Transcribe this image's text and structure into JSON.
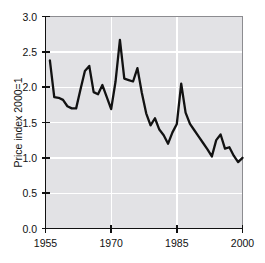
{
  "chart_data": {
    "type": "line",
    "title": "",
    "subtitle": "",
    "xlabel": "",
    "ylabel": "Price index 2000=1",
    "xlim": [
      1955,
      2000
    ],
    "ylim": [
      0.0,
      3.0
    ],
    "grid": true,
    "legend": "none",
    "x_ticks": [
      "1955",
      "1970",
      "1985",
      "2000"
    ],
    "x_tick_values": [
      1955,
      1970,
      1985,
      2000
    ],
    "y_ticks": [
      "0.0",
      "0.5",
      "1.0",
      "1.5",
      "2.0",
      "2.5",
      "3.0"
    ],
    "y_tick_values": [
      0.0,
      0.5,
      1.0,
      1.5,
      2.0,
      2.5,
      3.0
    ],
    "series": [
      {
        "name": "Price index 2000=1",
        "color": "#121212",
        "x": [
          1956,
          1957,
          1958,
          1959,
          1960,
          1961,
          1962,
          1963,
          1964,
          1965,
          1966,
          1967,
          1968,
          1969,
          1970,
          1971,
          1972,
          1973,
          1974,
          1975,
          1976,
          1977,
          1978,
          1979,
          1980,
          1981,
          1982,
          1983,
          1984,
          1985,
          1986,
          1987,
          1988,
          1989,
          1990,
          1991,
          1992,
          1993,
          1994,
          1995,
          1996,
          1997,
          1998,
          1999,
          2000
        ],
        "values": [
          2.38,
          1.86,
          1.85,
          1.82,
          1.73,
          1.7,
          1.7,
          1.97,
          2.23,
          2.3,
          1.93,
          1.9,
          2.03,
          1.86,
          1.69,
          2.08,
          2.67,
          2.12,
          2.1,
          2.08,
          2.27,
          1.92,
          1.63,
          1.46,
          1.56,
          1.4,
          1.32,
          1.2,
          1.36,
          1.48,
          2.05,
          1.64,
          1.48,
          1.39,
          1.3,
          1.21,
          1.12,
          1.02,
          1.25,
          1.33,
          1.13,
          1.15,
          1.03,
          0.94,
          1.0
        ]
      }
    ]
  },
  "axes": {
    "ylabel": "Price index 2000=1",
    "y_tick_labels": [
      "3.0",
      "2.5",
      "2.0",
      "1.5",
      "1.0",
      "0.5",
      "0.0"
    ],
    "x_tick_labels": [
      "1955",
      "1970",
      "1985",
      "2000"
    ]
  },
  "colors": {
    "plot_background": "#e2e2e5",
    "gridline": "#ffffff",
    "series": "#121212",
    "axis": "#111111",
    "frame": "#8c8c90",
    "page_background": "#ffffff"
  }
}
